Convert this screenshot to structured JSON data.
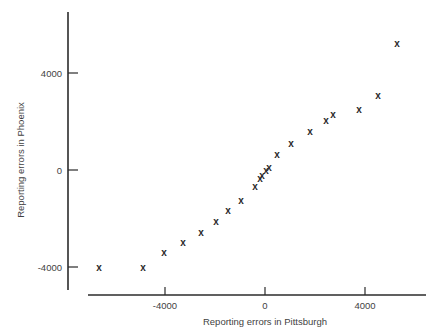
{
  "chart_data": {
    "type": "scatter",
    "title": "",
    "xlabel": "Reporting errors in Pittsburgh",
    "ylabel": "Reporting errors in Phoenix",
    "xlim": [
      -7900,
      6400
    ],
    "ylim": [
      -4900,
      6400
    ],
    "xticks": [
      -4000,
      0,
      4000
    ],
    "xticklabels": [
      "-4000",
      "0",
      "4000"
    ],
    "yticks": [
      -4000,
      0,
      4000
    ],
    "yticklabels": [
      "-4000",
      "0",
      "4000"
    ],
    "grid": false,
    "legend": null,
    "marker": "x",
    "series": [
      {
        "name": "Reporting error pairs",
        "points": [
          {
            "x": -6640,
            "y": -4000
          },
          {
            "x": -4880,
            "y": -4000
          },
          {
            "x": -4040,
            "y": -3420
          },
          {
            "x": -3280,
            "y": -2970
          },
          {
            "x": -2560,
            "y": -2560
          },
          {
            "x": -1960,
            "y": -2140
          },
          {
            "x": -1480,
            "y": -1690
          },
          {
            "x": -960,
            "y": -1240
          },
          {
            "x": -400,
            "y": -700
          },
          {
            "x": -200,
            "y": -330
          },
          {
            "x": -120,
            "y": -210
          },
          {
            "x": 40,
            "y": -40
          },
          {
            "x": 160,
            "y": 120
          },
          {
            "x": 480,
            "y": 620
          },
          {
            "x": 1040,
            "y": 1110
          },
          {
            "x": 1800,
            "y": 1600
          },
          {
            "x": 2440,
            "y": 2050
          },
          {
            "x": 2720,
            "y": 2270
          },
          {
            "x": 3760,
            "y": 2510
          },
          {
            "x": 4520,
            "y": 3090
          },
          {
            "x": 5280,
            "y": 5200
          }
        ]
      }
    ]
  },
  "axes": {
    "x_label": "Reporting errors in Pittsburgh",
    "y_label": "Reporting errors in Phoenix"
  },
  "colors": {
    "axis": "#2b2b2b",
    "marker": "#2a2a2a",
    "text": "#3f3f3f",
    "background": "#ffffff"
  }
}
